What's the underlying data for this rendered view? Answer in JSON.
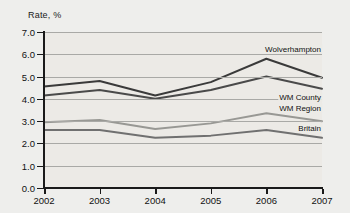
{
  "chart_data": {
    "type": "line",
    "title": "",
    "ylabel": "Rate, %",
    "xlabel": "",
    "categories": [
      "2002",
      "2003",
      "2004",
      "2005",
      "2006",
      "2007"
    ],
    "ylim": [
      0.0,
      7.0
    ],
    "ytick_labels": [
      "0.0",
      "1.0",
      "2.0",
      "3.0",
      "4.0",
      "5.0",
      "6.0",
      "7.0"
    ],
    "yticks": [
      0.0,
      1.0,
      2.0,
      3.0,
      4.0,
      5.0,
      6.0,
      7.0
    ],
    "grid": true,
    "legend_position": "inline-right",
    "series": [
      {
        "name": "Wolverhampton",
        "color": "#3a3a3a",
        "values": [
          4.55,
          4.8,
          4.15,
          4.75,
          5.8,
          4.95
        ]
      },
      {
        "name": "WM County",
        "color": "#4a4a4a",
        "values": [
          4.15,
          4.4,
          4.0,
          4.4,
          5.0,
          4.45
        ]
      },
      {
        "name": "WM Region",
        "color": "#989894",
        "values": [
          2.95,
          3.05,
          2.65,
          2.9,
          3.35,
          3.0
        ]
      },
      {
        "name": "Britain",
        "color": "#707070",
        "values": [
          2.6,
          2.6,
          2.25,
          2.35,
          2.6,
          2.25
        ]
      }
    ]
  },
  "colors": {
    "background": "#eeeeec",
    "plot_background": "#eceae6",
    "gridline": "#a9a9a6",
    "axis": "#1a1a1a",
    "text": "#111111"
  }
}
